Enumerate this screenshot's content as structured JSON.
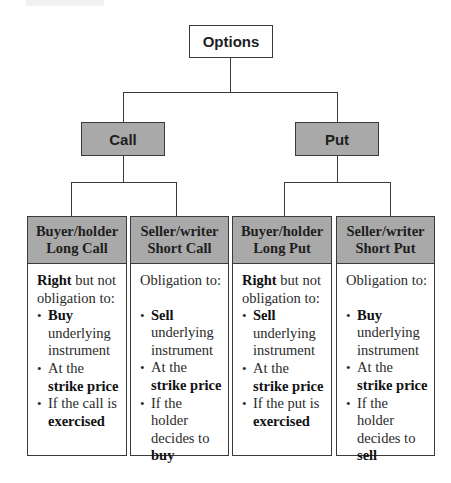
{
  "diagram": {
    "root": {
      "label": "Options"
    },
    "branches": [
      {
        "label": "Call",
        "leaves": [
          {
            "title_line1": "Buyer/holder",
            "title_line2": "Long Call",
            "intro_bold": "Right",
            "intro_rest": " but not obligation to:",
            "items": [
              {
                "bold": "Buy",
                "rest": " underlying instrument"
              },
              {
                "pre": "At the ",
                "bold": "strike price"
              },
              {
                "pre": "If the call is ",
                "bold": "exercised"
              }
            ]
          },
          {
            "title_line1": "Seller/writer",
            "title_line2": "Short Call",
            "intro": "Obligation to:",
            "items": [
              {
                "bold": "Sell",
                "rest": " underlying instrument"
              },
              {
                "pre": "At the ",
                "bold": "strike price"
              },
              {
                "pre": "If the holder decides to ",
                "bold": "buy"
              }
            ]
          }
        ]
      },
      {
        "label": "Put",
        "leaves": [
          {
            "title_line1": "Buyer/holder",
            "title_line2": "Long Put",
            "intro_bold": "Right",
            "intro_rest": " but not obligation to:",
            "items": [
              {
                "bold": "Sell",
                "rest": " underlying instrument"
              },
              {
                "pre": "At the ",
                "bold": "strike price"
              },
              {
                "pre": "If the put is ",
                "bold": "exercised"
              }
            ]
          },
          {
            "title_line1": "Seller/writer",
            "title_line2": "Short Put",
            "intro": "Obligation to:",
            "items": [
              {
                "bold": "Buy",
                "rest": " underlying instrument"
              },
              {
                "pre": "At the ",
                "bold": "strike price"
              },
              {
                "pre": "If the holder decides to ",
                "bold": "sell"
              }
            ]
          }
        ]
      }
    ]
  },
  "colors": {
    "node_fill": "#a9a9a9",
    "root_fill": "#ffffff",
    "border": "#3a3a3a",
    "text": "#1e1e1e"
  }
}
